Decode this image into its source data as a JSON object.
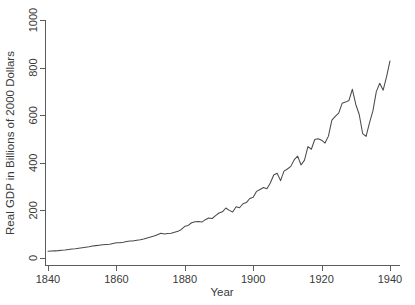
{
  "chart_data": {
    "type": "line",
    "title": "",
    "subtitle": "",
    "xlabel": "Year",
    "ylabel": "Real GDP in Billions of 2000 Dollars",
    "xlim": [
      1840,
      1940
    ],
    "ylim": [
      0,
      1000
    ],
    "xticks": [
      1840,
      1860,
      1880,
      1900,
      1920,
      1940
    ],
    "xticklabels": [
      "1840",
      "1860",
      "1880",
      "1900",
      "1920",
      "1940"
    ],
    "yticks": [
      0,
      200,
      400,
      600,
      800,
      1000
    ],
    "yticklabels": [
      "0",
      "200",
      "400",
      "600",
      "800",
      "1000"
    ],
    "grid": false,
    "legend": null,
    "legend_position": "none",
    "line_color": "#4a4a4a",
    "background_color": "#ffffff",
    "axis_color": "#5b5b5b",
    "spines": [
      "left",
      "bottom"
    ],
    "ytick_label_rotation": 90,
    "series": [
      {
        "name": "Real GDP",
        "x": [
          1840,
          1841,
          1842,
          1843,
          1844,
          1845,
          1846,
          1847,
          1848,
          1849,
          1850,
          1851,
          1852,
          1853,
          1854,
          1855,
          1856,
          1857,
          1858,
          1859,
          1860,
          1861,
          1862,
          1863,
          1864,
          1865,
          1866,
          1867,
          1868,
          1869,
          1870,
          1871,
          1872,
          1873,
          1874,
          1875,
          1876,
          1877,
          1878,
          1879,
          1880,
          1881,
          1882,
          1883,
          1884,
          1885,
          1886,
          1887,
          1888,
          1889,
          1890,
          1891,
          1892,
          1893,
          1894,
          1895,
          1896,
          1897,
          1898,
          1899,
          1900,
          1901,
          1902,
          1903,
          1904,
          1905,
          1906,
          1907,
          1908,
          1909,
          1910,
          1911,
          1912,
          1913,
          1914,
          1915,
          1916,
          1917,
          1918,
          1919,
          1920,
          1921,
          1922,
          1923,
          1924,
          1925,
          1926,
          1927,
          1928,
          1929,
          1930,
          1931,
          1932,
          1933,
          1934,
          1935,
          1936,
          1937,
          1938,
          1939,
          1940
        ],
        "y": [
          28,
          29,
          30,
          31,
          33,
          34,
          36,
          38,
          39,
          41,
          43,
          45,
          47,
          50,
          52,
          54,
          56,
          57,
          58,
          61,
          64,
          64,
          66,
          69,
          71,
          72,
          75,
          77,
          80,
          84,
          88,
          92,
          98,
          104,
          101,
          103,
          104,
          108,
          112,
          120,
          133,
          137,
          148,
          152,
          153,
          151,
          161,
          168,
          166,
          178,
          189,
          194,
          210,
          200,
          193,
          215,
          211,
          228,
          233,
          250,
          255,
          280,
          288,
          296,
          291,
          315,
          349,
          356,
          325,
          365,
          374,
          385,
          413,
          428,
          391,
          411,
          468,
          457,
          498,
          501,
          495,
          483,
          512,
          579,
          595,
          609,
          650,
          655,
          662,
          709,
          645,
          603,
          523,
          511,
          568,
          618,
          699,
          734,
          705,
          762,
          828
        ],
        "units": "Billions of 2000 Dollars",
        "start_value": 28,
        "end_value": 975,
        "peak_1929": 820,
        "trough_1933": 600
      }
    ],
    "annotations": []
  },
  "figure": {
    "name": "us-real-gdp-line-chart",
    "width": 415,
    "height": 305
  }
}
